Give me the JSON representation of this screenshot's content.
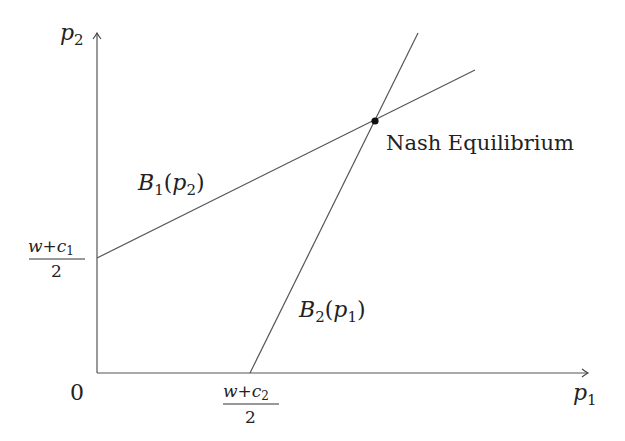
{
  "diagram": {
    "type": "best-response-functions",
    "axes": {
      "x_label": "p",
      "x_label_sub": "1",
      "y_label": "p",
      "y_label_sub": "2",
      "origin_label": "0"
    },
    "intercepts": {
      "y_intercept": {
        "num_w": "w",
        "num_plus": "+",
        "num_c": "c",
        "num_sub": "1",
        "den": "2"
      },
      "x_intercept": {
        "num_w": "w",
        "num_plus": "+",
        "num_c": "c",
        "num_sub": "2",
        "den": "2"
      }
    },
    "curves": [
      {
        "name": "B",
        "sub": "1",
        "arg": "p",
        "arg_sub": "2",
        "open": "(",
        "close": ")"
      },
      {
        "name": "B",
        "sub": "2",
        "arg": "p",
        "arg_sub": "1",
        "open": "(",
        "close": ")"
      }
    ],
    "equilibrium_label": "Nash Equilibrium",
    "colors": {
      "line": "#555555",
      "text": "#222222",
      "point": "#111111"
    }
  }
}
